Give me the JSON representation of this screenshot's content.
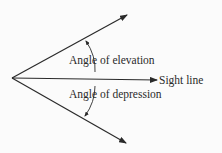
{
  "diagram": {
    "labels": {
      "elevation": "Angle of elevation",
      "depression": "Angle of depression",
      "sight_line": "Sight line"
    },
    "colors": {
      "line": "#2a2a2a",
      "background": "#fbfbfb"
    }
  }
}
